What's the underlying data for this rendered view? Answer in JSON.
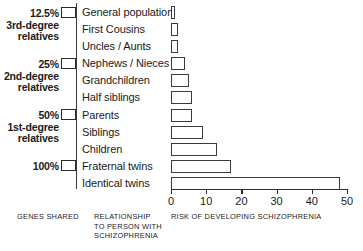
{
  "figure": {
    "captions": {
      "genes_shared": "GENES SHARED",
      "relationship": "RELATIONSHIP\nTO PERSON WITH\nSCHIZOPHRENIA",
      "risk": "RISK OF DEVELOPING SCHIZOPHRENIA"
    },
    "genes_groups": [
      {
        "percent": "12.5%",
        "degree": "3rd-degree\nrelatives"
      },
      {
        "percent": "25%",
        "degree": "2nd-degree\nrelatives"
      },
      {
        "percent": "50%",
        "degree": "1st-degree\nrelatives"
      },
      {
        "percent": "100%",
        "degree": ""
      }
    ]
  },
  "chart_data": {
    "type": "bar",
    "orientation": "horizontal",
    "title": "",
    "xlabel": "RISK OF DEVELOPING SCHIZOPHRENIA",
    "ylabel": "RELATIONSHIP TO PERSON WITH SCHIZOPHRENIA",
    "xlim": [
      0,
      50
    ],
    "ticks": [
      0,
      10,
      20,
      30,
      40,
      50
    ],
    "grid": false,
    "legend": "none",
    "bar_color": "#ffffff",
    "bar_edge_color": "#3a3a3a",
    "categories": [
      "General population",
      "First Cousins",
      "Uncles / Aunts",
      "Nephews / Nieces",
      "Grandchildren",
      "Half siblings",
      "Parents",
      "Siblings",
      "Children",
      "Fraternal twins",
      "Identical twins"
    ],
    "values": [
      1,
      2,
      2,
      4,
      5,
      6,
      6,
      9,
      13,
      17,
      48
    ],
    "genes_shared_percent": [
      "12.5%",
      "12.5%",
      "12.5%",
      "25%",
      "25%",
      "25%",
      "50%",
      "50%",
      "50%",
      "50%",
      "100%"
    ]
  }
}
